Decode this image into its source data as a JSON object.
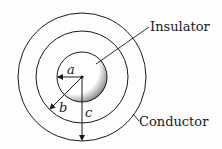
{
  "diagram": {
    "type": "coaxial-cross-section",
    "labels": {
      "insulator": "Insulator",
      "conductor": "Conductor"
    },
    "radii_labels": {
      "a": "a",
      "b": "b",
      "c": "c"
    },
    "colors": {
      "stroke": "#1a1a1a",
      "background": "#fdfdfd"
    }
  }
}
